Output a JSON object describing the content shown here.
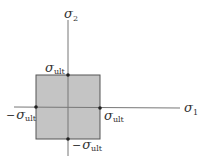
{
  "diagram": {
    "colors": {
      "region_fill": "#c4c4c4",
      "stroke": "#555555",
      "axis": "#777777",
      "text": "#333333",
      "background": "#ffffff"
    },
    "axes": {
      "horizontal": {
        "symbol": "σ",
        "subscript": "1"
      },
      "vertical": {
        "symbol": "σ",
        "subscript": "2"
      }
    },
    "labels": {
      "top": {
        "prefix": "",
        "symbol": "σ",
        "subscript": "ult"
      },
      "right": {
        "prefix": "",
        "symbol": "σ",
        "subscript": "ult"
      },
      "left": {
        "prefix": "−",
        "symbol": "σ",
        "subscript": "ult"
      },
      "bottom": {
        "prefix": "−",
        "symbol": "σ",
        "subscript": "ult"
      }
    },
    "region": {
      "shape": "square",
      "label": "safe region",
      "corners": [
        "(−σult, σult)",
        "(σult, σult)",
        "(σult, −σult)",
        "(−σult, −σult)"
      ]
    },
    "points": [
      {
        "name": "top",
        "coords": "(0, σult)"
      },
      {
        "name": "right",
        "coords": "(σult, 0)"
      },
      {
        "name": "bottom",
        "coords": "(0, −σult)"
      },
      {
        "name": "left",
        "coords": "(−σult, 0)"
      }
    ]
  }
}
